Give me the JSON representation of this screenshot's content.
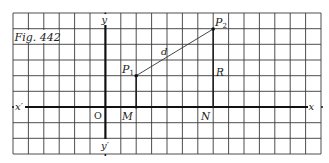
{
  "figure": {
    "caption": "Fig. 442",
    "axes": {
      "x_label": "x",
      "x_neg_label": "x′",
      "y_label": "y",
      "y_neg_label": "y′",
      "origin_label": "O"
    },
    "points": {
      "p1": {
        "label": "P",
        "sub": "1"
      },
      "p2": {
        "label": "P",
        "sub": "2"
      },
      "m": {
        "label": "M"
      },
      "n": {
        "label": "N"
      }
    },
    "segments": {
      "distance_label": "d",
      "ordinate_label": "R"
    },
    "grid": {
      "columns": 20,
      "rows": 9,
      "line_color": "#3a3a3a",
      "axis_color": "#111111"
    }
  }
}
